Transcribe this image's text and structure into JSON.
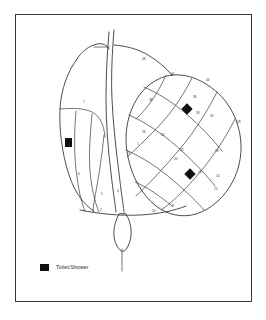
{
  "map": {
    "title": "Campsite Pitch Map",
    "frame": {
      "stroke": "#3a3a3a",
      "background": "#ffffff"
    },
    "line_color": "#2e2e2e",
    "facility_color": "#111111"
  },
  "legend": {
    "items": [
      {
        "swatch_color": "#111111",
        "label": "Toilet/Shower",
        "icon": "filled-square-icon"
      }
    ]
  },
  "facilities": [
    {
      "name": "toilet-shower-west",
      "x": 49,
      "y": 123,
      "width": 7,
      "height": 9
    },
    {
      "name": "toilet-shower-north-east",
      "x": 167,
      "y": 90,
      "width": 8,
      "height": 8
    },
    {
      "name": "toilet-shower-south-east",
      "x": 170,
      "y": 155,
      "width": 8,
      "height": 8
    }
  ],
  "pitch_labels": [
    {
      "text": "48",
      "x": 126,
      "y": 45
    },
    {
      "text": "41",
      "x": 155,
      "y": 60
    },
    {
      "text": "44",
      "x": 190,
      "y": 66
    },
    {
      "text": "38",
      "x": 133,
      "y": 86
    },
    {
      "text": "36",
      "x": 177,
      "y": 83
    },
    {
      "text": "33",
      "x": 180,
      "y": 99
    },
    {
      "text": "30",
      "x": 194,
      "y": 102
    },
    {
      "text": "28",
      "x": 221,
      "y": 108
    },
    {
      "text": "26",
      "x": 126,
      "y": 118
    },
    {
      "text": "24",
      "x": 145,
      "y": 121
    },
    {
      "text": "22",
      "x": 164,
      "y": 136
    },
    {
      "text": "20",
      "x": 158,
      "y": 145
    },
    {
      "text": "18",
      "x": 199,
      "y": 137
    },
    {
      "text": "16",
      "x": 182,
      "y": 158
    },
    {
      "text": "14",
      "x": 200,
      "y": 162
    },
    {
      "text": "12",
      "x": 198,
      "y": 175
    },
    {
      "text": "10",
      "x": 136,
      "y": 197
    },
    {
      "text": "8",
      "x": 156,
      "y": 192
    },
    {
      "text": "7",
      "x": 67,
      "y": 88
    },
    {
      "text": "6",
      "x": 62,
      "y": 160
    },
    {
      "text": "5",
      "x": 85,
      "y": 180
    },
    {
      "text": "4",
      "x": 101,
      "y": 177
    },
    {
      "text": "3",
      "x": 112,
      "y": 139
    },
    {
      "text": "2",
      "x": 84,
      "y": 196
    },
    {
      "text": "1",
      "x": 121,
      "y": 130
    }
  ]
}
